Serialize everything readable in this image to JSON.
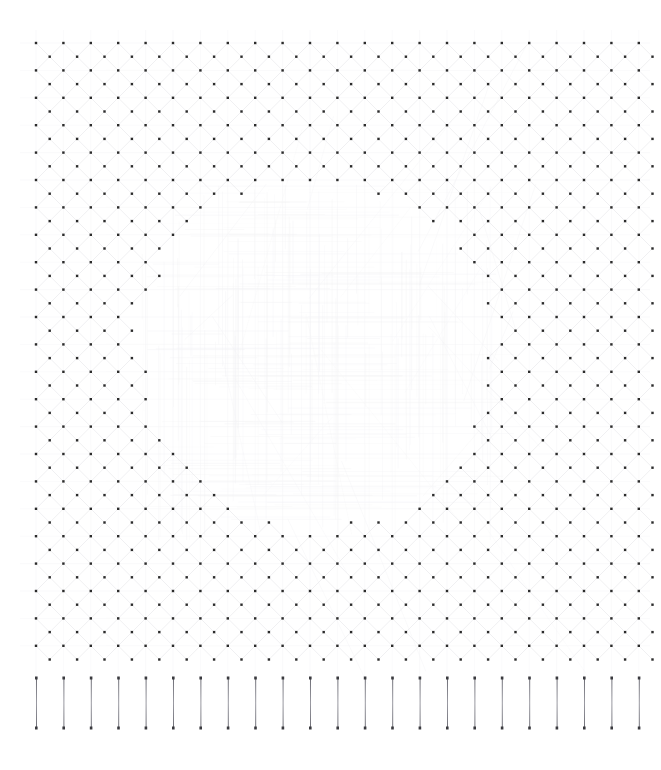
{
  "figure": {
    "title": "",
    "background_color": "#ffffff",
    "width": 661,
    "height": 770
  },
  "chart_data": {
    "type": "scatter",
    "title": "",
    "subtitle": "",
    "xlabel": "",
    "ylabel": "",
    "grid": true,
    "legend": null,
    "legend_position": "none",
    "xlim": [
      0,
      661
    ],
    "ylim": [
      770,
      0
    ],
    "axis_visible": false,
    "tick_labels_x": [],
    "tick_labels_y": [],
    "annotations": [],
    "colors": {
      "node": "#2b2b2b",
      "mesh_line": "#e9e9ec",
      "ghost_line": "#f3f3f5",
      "bar_line": "#6e6e76",
      "bar_endpoint": "#3a3a3f",
      "background": "#ffffff"
    },
    "series": [
      {
        "name": "lattice-nodes",
        "kind": "scatter",
        "marker": "square",
        "marker_size_px": 2.4,
        "color": "#2b2b2b",
        "grid_origin_x": 36,
        "grid_origin_y": 43,
        "grid_spacing_x": 27.4,
        "grid_spacing_y": 27.4,
        "grid_cols": 23,
        "grid_rows": 23,
        "sublattice_offset_x": 13.7,
        "sublattice_offset_y": 13.7,
        "void_center_x": 318,
        "void_center_y": 352,
        "void_radius_x": 176,
        "void_radius_y": 168,
        "void_irregularity": 0.085,
        "point_count": 1012
      },
      {
        "name": "mesh-edges",
        "kind": "line",
        "color": "#e9e9ec",
        "line_width_px": 0.7,
        "orientation": "diagonal-diamond",
        "edge_count": 1900
      },
      {
        "name": "ghost-field-lines",
        "kind": "line",
        "color": "#f3f3f5",
        "line_width_px": 0.6,
        "region": "void-interior",
        "line_count": 260
      },
      {
        "name": "vertical-bar-elements",
        "kind": "segments",
        "color": "#6e6e76",
        "endpoint_color": "#3a3a3f",
        "line_width_px": 1.0,
        "count": 23,
        "origin_x": 36,
        "spacing_x": 27.4,
        "y_top": 678,
        "y_bottom": 728,
        "length_px": 50
      }
    ],
    "x": [],
    "values": []
  },
  "labels": {
    "plot_area": "lattice-plot-area",
    "bars_area": "vertical-bars-area"
  }
}
